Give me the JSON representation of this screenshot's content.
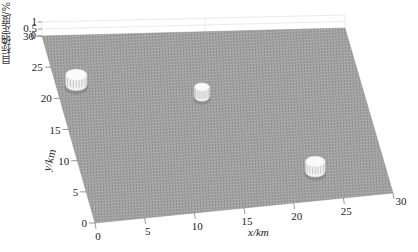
{
  "chart_data": {
    "type": "surface3d",
    "title": "",
    "xlabel": "x/km",
    "ylabel": "y/km",
    "zlabel": "目标确定度/%",
    "xlim": [
      0,
      30
    ],
    "ylim": [
      0,
      30
    ],
    "zlim": [
      0,
      1
    ],
    "x_ticks": [
      "0",
      "5",
      "10",
      "15",
      "20",
      "25",
      "30"
    ],
    "y_ticks": [
      "0",
      "5",
      "10",
      "15",
      "20",
      "25",
      "30"
    ],
    "z_ticks": [
      "0",
      "0.5",
      "1"
    ],
    "grid": false,
    "surface_color": "#9a9a9a",
    "peak_color": "#f2f2f2",
    "base_value": 0,
    "targets": [
      {
        "x": 2.0,
        "y": 22.0,
        "radius": 1.4,
        "certainty": 1
      },
      {
        "x": 14.0,
        "y": 19.0,
        "radius": 1.0,
        "certainty": 1
      },
      {
        "x": 23.0,
        "y": 5.0,
        "radius": 1.3,
        "certainty": 1
      }
    ]
  },
  "labels": {
    "x_axis": "x/km",
    "y_axis": "y/km",
    "z_axis": "目标确定度/%"
  }
}
